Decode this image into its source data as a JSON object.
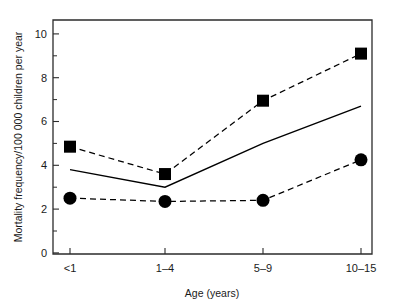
{
  "chart_data": {
    "type": "line",
    "title": "",
    "xlabel": "Age (years)",
    "ylabel": "Mortality frequency/100 000 children per year",
    "categories": [
      "<1",
      "1–4",
      "5–9",
      "10–15"
    ],
    "ylim": [
      0,
      10.6
    ],
    "yticks": [
      0,
      2,
      4,
      6,
      8,
      10
    ],
    "ytick_labels": [
      "0",
      "2",
      "4",
      "6",
      "8",
      "10"
    ],
    "yminor_ticks": [
      1,
      3,
      5,
      7,
      9
    ],
    "grid": false,
    "legend": "none",
    "series": [
      {
        "name": "upper-series",
        "marker": "square",
        "linestyle": "dashed",
        "color": "#000000",
        "values": [
          4.85,
          3.6,
          6.95,
          9.1
        ]
      },
      {
        "name": "middle-series",
        "marker": "none",
        "linestyle": "solid",
        "color": "#000000",
        "values": [
          3.8,
          3.0,
          5.0,
          6.7
        ]
      },
      {
        "name": "lower-series",
        "marker": "circle",
        "linestyle": "dashed",
        "color": "#000000",
        "values": [
          2.5,
          2.35,
          2.4,
          4.25
        ]
      }
    ]
  },
  "axis": {
    "y_label_text": "Mortality frequency/100 000 children per year",
    "x_label_text": "Age (years)"
  },
  "ticks": {
    "y": [
      "10",
      "8",
      "6",
      "4",
      "2",
      "0"
    ],
    "x": [
      "<1",
      "1–4",
      "5–9",
      "10–15"
    ]
  }
}
